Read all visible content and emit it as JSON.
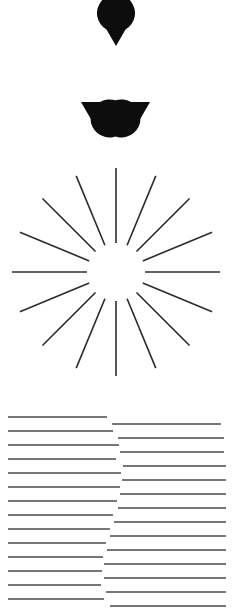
{
  "page": {
    "background_color": "#ffffff",
    "ink_color": "#000000",
    "line_color": "#4a4a4a",
    "width": 234,
    "height": 608,
    "panel_count": 3
  },
  "figures": [
    {
      "id": "kanizsa-triangle",
      "name": "Kanizsa Triangle",
      "type": "illusory-contour",
      "element_kind": "pacman-disc",
      "element_count": 3,
      "fill_color": "#0d0d0d",
      "disc_radius": 19,
      "wedge_angle_deg": 60,
      "discs": [
        {
          "label": "top-disc",
          "cx": 116,
          "cy": 46,
          "r": 19,
          "notch_direction_deg": 90
        },
        {
          "label": "bottom-left-disc",
          "cx": 81,
          "cy": 102,
          "r": 19,
          "notch_direction_deg": 330
        },
        {
          "label": "bottom-right-disc",
          "cx": 150,
          "cy": 102,
          "r": 19,
          "notch_direction_deg": 210
        }
      ]
    },
    {
      "id": "radial-starburst",
      "name": "Radial Starburst",
      "type": "radiating-lines",
      "ray_count": 16,
      "angle_step_deg": 22.5,
      "center_x": 116,
      "center_y": 122,
      "inner_radius": 29,
      "outer_radius": 104,
      "stroke_color": "#2b2b2b",
      "stroke_width": 1.6
    },
    {
      "id": "illusory-edge-lines",
      "name": "Illusory Edge Line Grating",
      "type": "horizontal-line-grating",
      "left_line_count": 14,
      "right_line_count": 14,
      "left_start_x": 8,
      "right_end_x": 226,
      "line_spacing": 14,
      "stroke_color": "#4a4a4a",
      "stroke_width": 1.3,
      "left_lines": [
        {
          "y": 22,
          "x1": 8,
          "x2": 107
        },
        {
          "y": 36,
          "x1": 8,
          "x2": 113
        },
        {
          "y": 50,
          "x1": 8,
          "x2": 119
        },
        {
          "y": 64,
          "x1": 8,
          "x2": 116
        },
        {
          "y": 78,
          "x1": 8,
          "x2": 121
        },
        {
          "y": 92,
          "x1": 8,
          "x2": 120
        },
        {
          "y": 106,
          "x1": 8,
          "x2": 117
        },
        {
          "y": 120,
          "x1": 8,
          "x2": 113
        },
        {
          "y": 134,
          "x1": 8,
          "x2": 110
        },
        {
          "y": 148,
          "x1": 8,
          "x2": 106
        },
        {
          "y": 162,
          "x1": 8,
          "x2": 103
        },
        {
          "y": 176,
          "x1": 8,
          "x2": 102
        },
        {
          "y": 190,
          "x1": 8,
          "x2": 101
        },
        {
          "y": 204,
          "x1": 8,
          "x2": 104
        }
      ],
      "right_lines": [
        {
          "y": 29,
          "x1": 112,
          "x2": 221
        },
        {
          "y": 43,
          "x1": 118,
          "x2": 224
        },
        {
          "y": 57,
          "x1": 120,
          "x2": 224
        },
        {
          "y": 71,
          "x1": 123,
          "x2": 226
        },
        {
          "y": 85,
          "x1": 122,
          "x2": 226
        },
        {
          "y": 99,
          "x1": 120,
          "x2": 226
        },
        {
          "y": 113,
          "x1": 118,
          "x2": 226
        },
        {
          "y": 127,
          "x1": 114,
          "x2": 226
        },
        {
          "y": 141,
          "x1": 110,
          "x2": 226
        },
        {
          "y": 155,
          "x1": 107,
          "x2": 226
        },
        {
          "y": 169,
          "x1": 104,
          "x2": 226
        },
        {
          "y": 183,
          "x1": 104,
          "x2": 226
        },
        {
          "y": 197,
          "x1": 106,
          "x2": 226
        },
        {
          "y": 211,
          "x1": 110,
          "x2": 226
        }
      ]
    }
  ]
}
